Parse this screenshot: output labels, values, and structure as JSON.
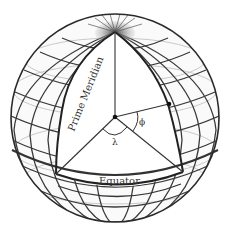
{
  "diagram": {
    "type": "geographic-coordinate-sphere",
    "labels": {
      "prime_meridian": "Prime Meridian",
      "equator": "Equator",
      "longitude_symbol": "λ",
      "latitude_symbol": "ϕ"
    },
    "points": {
      "north_pole": [
        115,
        32
      ],
      "center": [
        115,
        117
      ],
      "surface_point": [
        169,
        104
      ],
      "equator_prime_meridian": [
        56,
        174
      ],
      "equator_point_meridian": [
        183,
        172
      ]
    },
    "colors": {
      "outline": "#2a2a2a",
      "grid": "#3a3a3a",
      "grid_light": "#9a9a9a",
      "background": "#ffffff",
      "pole_shade": "#6a6a6a"
    }
  }
}
